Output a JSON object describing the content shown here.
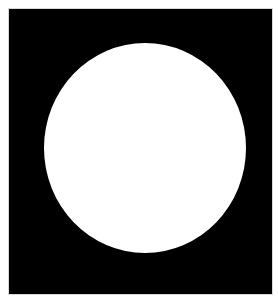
{
  "image": {
    "description": "White circle on black square background",
    "colors": {
      "background": "#000000",
      "circle": "#ffffff",
      "border": "#d8d8d8"
    }
  }
}
